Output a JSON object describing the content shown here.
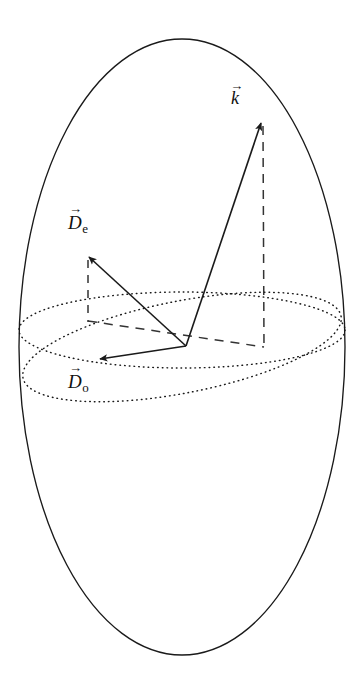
{
  "figure": {
    "background_color": "#ffffff",
    "stroke_color": "#1a1a1a",
    "width": 362,
    "height": 693
  },
  "labels": {
    "k": {
      "symbol": "k",
      "subscript": "",
      "arrow": "→",
      "name": "wave-vector-k"
    },
    "De": {
      "symbol": "D",
      "subscript": "e",
      "arrow": "→",
      "name": "extraordinary-displacement"
    },
    "Do": {
      "symbol": "D",
      "subscript": "o",
      "arrow": "→",
      "name": "ordinary-displacement"
    }
  },
  "geometry": {
    "origin": {
      "x": 186,
      "y": 346
    },
    "outer_sphere": {
      "cx": 182,
      "cy": 347,
      "rx": 163,
      "ry": 308,
      "style": "solid"
    },
    "equatorial_ellipse": {
      "cx": 182,
      "cy": 330,
      "rx": 163,
      "ry": 38,
      "rotation": 0,
      "style": "dotted"
    },
    "tilted_ellipse": {
      "cx": 182,
      "cy": 347,
      "rx": 162,
      "ry": 46,
      "rotation": -11,
      "style": "dotted"
    },
    "vectors": [
      {
        "name": "k",
        "from": {
          "x": 186,
          "y": 346
        },
        "to": {
          "x": 262,
          "y": 120
        },
        "style": "solid",
        "arrowhead": true
      },
      {
        "name": "De",
        "from": {
          "x": 186,
          "y": 346
        },
        "to": {
          "x": 88,
          "y": 256
        },
        "style": "solid",
        "arrowhead": true
      },
      {
        "name": "Do",
        "from": {
          "x": 186,
          "y": 346
        },
        "to": {
          "x": 99,
          "y": 360
        },
        "style": "solid",
        "arrowhead": true
      }
    ],
    "projection_lines": [
      {
        "name": "k-vertical-drop",
        "from": {
          "x": 263,
          "y": 124
        },
        "to": {
          "x": 264,
          "y": 347
        },
        "style": "dashed"
      },
      {
        "name": "De-vertical-drop",
        "from": {
          "x": 88,
          "y": 259
        },
        "to": {
          "x": 88,
          "y": 321
        },
        "style": "dashed"
      },
      {
        "name": "horizontal-base-line",
        "from": {
          "x": 88,
          "y": 321
        },
        "to": {
          "x": 264,
          "y": 347
        },
        "style": "dashed"
      }
    ]
  }
}
